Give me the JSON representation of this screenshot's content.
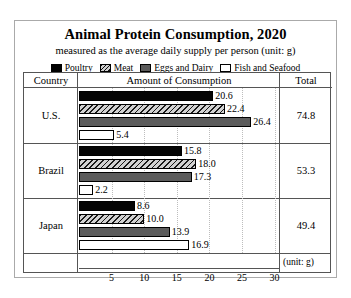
{
  "chart_data": {
    "type": "bar",
    "title": "Animal Protein Consumption, 2020",
    "subtitle": "measured as the average daily supply per person (unit: g)",
    "orientation": "horizontal",
    "grouped": true,
    "xlabel": "(unit: g)",
    "ylabel": "",
    "xlim": [
      0,
      32
    ],
    "xticks": [
      5,
      10,
      15,
      20,
      25,
      30
    ],
    "grid": true,
    "legend_position": "top",
    "categories": [
      "U.S.",
      "Brazil",
      "Japan"
    ],
    "series": [
      {
        "name": "Poultry",
        "color": "#000000",
        "pattern": "solid-black",
        "values": [
          20.6,
          15.8,
          8.6
        ]
      },
      {
        "name": "Meat",
        "color": "#cfcfcf",
        "pattern": "diagonal-hatch",
        "values": [
          22.4,
          18.0,
          10.0
        ]
      },
      {
        "name": "Eggs and Dairy",
        "color": "#5c5c5c",
        "pattern": "solid-gray",
        "values": [
          26.4,
          17.3,
          13.9
        ]
      },
      {
        "name": "Fish and Seafood",
        "color": "#ffffff",
        "pattern": "outline-white",
        "values": [
          5.4,
          2.2,
          16.9
        ]
      }
    ],
    "totals": [
      74.8,
      53.3,
      49.4
    ]
  },
  "table": {
    "headers": [
      "Country",
      "Amount of Consumption",
      "Total"
    ],
    "rows": [
      {
        "country": "U.S.",
        "total": "74.8",
        "bars": [
          {
            "series": "Poultry",
            "value": 20.6,
            "label": "20.6"
          },
          {
            "series": "Meat",
            "value": 22.4,
            "label": "22.4"
          },
          {
            "series": "Eggs and Dairy",
            "value": 26.4,
            "label": "26.4"
          },
          {
            "series": "Fish and Seafood",
            "value": 5.4,
            "label": "5.4"
          }
        ]
      },
      {
        "country": "Brazil",
        "total": "53.3",
        "bars": [
          {
            "series": "Poultry",
            "value": 15.8,
            "label": "15.8"
          },
          {
            "series": "Meat",
            "value": 18.0,
            "label": "18.0"
          },
          {
            "series": "Eggs and Dairy",
            "value": 17.3,
            "label": "17.3"
          },
          {
            "series": "Fish and Seafood",
            "value": 2.2,
            "label": "2.2"
          }
        ]
      },
      {
        "country": "Japan",
        "total": "49.4",
        "bars": [
          {
            "series": "Poultry",
            "value": 8.6,
            "label": "8.6"
          },
          {
            "series": "Meat",
            "value": 10.0,
            "label": "10.0"
          },
          {
            "series": "Eggs and Dairy",
            "value": 13.9,
            "label": "13.9"
          },
          {
            "series": "Fish and Seafood",
            "value": 16.9,
            "label": "16.9"
          }
        ]
      }
    ]
  },
  "legend": {
    "items": [
      {
        "label": "Poultry",
        "swatch": "poultry-swatch"
      },
      {
        "label": "Meat",
        "swatch": "meat-swatch"
      },
      {
        "label": "Eggs and Dairy",
        "swatch": "eggs-and-dairy-swatch"
      },
      {
        "label": "Fish and Seafood",
        "swatch": "fish-and-seafood-swatch"
      }
    ]
  },
  "axis": {
    "ticks": [
      "5",
      "10",
      "15",
      "20",
      "25",
      "30"
    ],
    "unit_label": "(unit: g)"
  }
}
